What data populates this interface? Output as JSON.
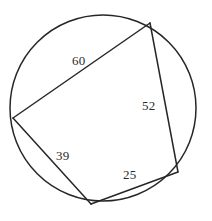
{
  "figure": {
    "background_color": "#ffffff",
    "stroke_color": "#262626",
    "label_color": "#2b2b2b",
    "stroke_width": 1.5,
    "width": 212,
    "height": 221
  },
  "circle": {
    "name": "circumscribed-circle",
    "center_x": 103,
    "center_y": 108,
    "radius": 93
  },
  "vertices": [
    {
      "id": "top-right",
      "x": 150,
      "y": 23
    },
    {
      "id": "left",
      "x": 13,
      "y": 118
    },
    {
      "id": "bottom",
      "x": 91,
      "y": 204
    },
    {
      "id": "bottom-right",
      "x": 178,
      "y": 172
    }
  ],
  "sides": [
    {
      "id": "top-left-side",
      "from": "left",
      "to": "top-right",
      "label": "60"
    },
    {
      "id": "right-side",
      "from": "top-right",
      "to": "bottom-right",
      "label": "52"
    },
    {
      "id": "bottom-side",
      "from": "bottom-right",
      "to": "bottom",
      "label": "25"
    },
    {
      "id": "bottom-left-side",
      "from": "bottom",
      "to": "left",
      "label": "39"
    }
  ],
  "labels": {
    "side_60": "60",
    "side_52": "52",
    "side_39": "39",
    "side_25": "25"
  }
}
